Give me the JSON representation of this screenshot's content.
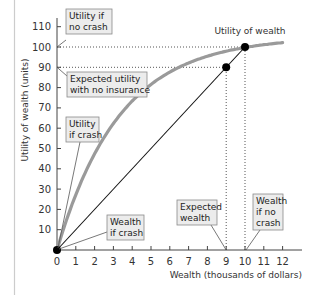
{
  "chart_data": {
    "type": "line",
    "title": "",
    "xlabel": "Wealth (thousands of dollars)",
    "ylabel": "Utility of wealth (units)",
    "xlim": [
      0,
      12.5
    ],
    "ylim": [
      0,
      115
    ],
    "x_ticks": [
      0,
      1,
      2,
      3,
      4,
      5,
      6,
      7,
      8,
      9,
      10,
      11,
      12
    ],
    "y_ticks": [
      10,
      20,
      30,
      40,
      50,
      60,
      70,
      80,
      90,
      100,
      110
    ],
    "grid": false,
    "legend": null,
    "series": [
      {
        "name": "Utility of wealth",
        "style": "thick grey curve",
        "color": "#9a9a9a",
        "x": [
          0,
          1,
          2,
          3,
          4,
          5,
          6,
          7,
          8,
          9,
          10,
          11,
          12
        ],
        "y": [
          0,
          27,
          47,
          62,
          73,
          82,
          88,
          92,
          95,
          98,
          100,
          101.5,
          103
        ]
      },
      {
        "name": "Expected utility line",
        "style": "thin black line",
        "color": "#111111",
        "x": [
          0,
          10
        ],
        "y": [
          0,
          100
        ]
      }
    ],
    "points": [
      {
        "x": 0,
        "y": 0,
        "label": "Wealth if crash / Utility if crash"
      },
      {
        "x": 9,
        "y": 90,
        "label": "Expected wealth / Expected utility with no insurance"
      },
      {
        "x": 10,
        "y": 100,
        "label": "Wealth if no crash / Utility if no crash"
      }
    ],
    "reference_lines": [
      {
        "type": "horizontal-dotted",
        "y": 100,
        "x_to": 10
      },
      {
        "type": "horizontal-dotted",
        "y": 90,
        "x_to": 9
      },
      {
        "type": "vertical-dotted",
        "x": 9,
        "y_to": 90
      },
      {
        "type": "vertical-dotted",
        "x": 10,
        "y_to": 100
      }
    ],
    "annotations": [
      {
        "text": [
          "Utility if",
          "no crash"
        ],
        "points_to": [
          0,
          100
        ]
      },
      {
        "text": [
          "Expected utility",
          "with no insurance"
        ],
        "points_to": [
          0,
          90
        ]
      },
      {
        "text": [
          "Utility",
          "if crash"
        ],
        "points_to": [
          0,
          0
        ]
      },
      {
        "text": [
          "Wealth",
          "if crash"
        ],
        "points_to": [
          0,
          0
        ]
      },
      {
        "text": [
          "Expected",
          "wealth"
        ],
        "points_to": [
          9,
          0
        ]
      },
      {
        "text": [
          "Wealth",
          "if no",
          "crash"
        ],
        "points_to": [
          10,
          0
        ]
      },
      {
        "text": [
          "Utility of wealth"
        ],
        "points_to": "curve"
      }
    ]
  },
  "labels": {
    "curve_label": "Utility of wealth",
    "xlabel": "Wealth (thousands of dollars)",
    "ylabel": "Utility of wealth (units)",
    "utility_no_crash": [
      "Utility if",
      "no crash"
    ],
    "expected_utility": [
      "Expected utility",
      "with no insurance"
    ],
    "utility_crash": [
      "Utility",
      "if crash"
    ],
    "wealth_crash": [
      "Wealth",
      "if crash"
    ],
    "expected_wealth": [
      "Expected",
      "wealth"
    ],
    "wealth_no_crash": [
      "Wealth",
      "if no",
      "crash"
    ]
  },
  "colors": {
    "curve": "#9a9a9a",
    "line": "#111111",
    "box_fill": "#ececec",
    "box_stroke": "#8a8a8a",
    "axis": "#444444",
    "page_border": "#cccccc"
  }
}
